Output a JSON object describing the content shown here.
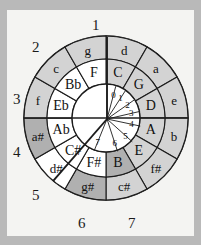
{
  "diagram": {
    "center": {
      "x": 106,
      "y": 118
    },
    "radii": {
      "outer": 82,
      "ring_mid": 59,
      "ring_inner": 34,
      "core": 22
    },
    "colors": {
      "page_background": "#b9b9b9",
      "paper": "#f4f4f2",
      "shaded_sector": "#b0b0b0",
      "light_sector": "#d3d3d3",
      "white_sector": "#ffffff",
      "stroke": "#1c1c1c",
      "text": "#111111"
    },
    "outer_ring": {
      "name": "minor-keys-ring",
      "segments": [
        {
          "label": "d",
          "angle": -75,
          "fill": "light"
        },
        {
          "label": "a",
          "angle": -45,
          "fill": "light"
        },
        {
          "label": "e",
          "angle": -15,
          "fill": "light"
        },
        {
          "label": "b",
          "angle": 15,
          "fill": "light"
        },
        {
          "label": "f#",
          "angle": 45,
          "fill": "light"
        },
        {
          "label": "c#",
          "angle": 75,
          "fill": "light"
        },
        {
          "label": "g#",
          "angle": 105,
          "fill": "shaded"
        },
        {
          "label": "d#",
          "angle": 135,
          "fill": "white"
        },
        {
          "label": "a#",
          "angle": 165,
          "fill": "shaded"
        },
        {
          "label": "f",
          "angle": -165,
          "fill": "light"
        },
        {
          "label": "c",
          "angle": -135,
          "fill": "light"
        },
        {
          "label": "g",
          "angle": -105,
          "fill": "light"
        }
      ]
    },
    "middle_ring": {
      "name": "major-keys-ring",
      "segments": [
        {
          "label": "C",
          "angle": -75,
          "fill": "light"
        },
        {
          "label": "G",
          "angle": -45,
          "fill": "light"
        },
        {
          "label": "D",
          "angle": -15,
          "fill": "light"
        },
        {
          "label": "A",
          "angle": 15,
          "fill": "light"
        },
        {
          "label": "E",
          "angle": 45,
          "fill": "light"
        },
        {
          "label": "B",
          "angle": 75,
          "fill": "shaded"
        },
        {
          "label": "F#",
          "angle": 105,
          "fill": "white"
        },
        {
          "label": "C#",
          "angle": 135,
          "fill": "white"
        },
        {
          "label": "Ab",
          "angle": 165,
          "fill": "white"
        },
        {
          "label": "Eb",
          "angle": -165,
          "fill": "white"
        },
        {
          "label": "Bb",
          "angle": -135,
          "fill": "white"
        },
        {
          "label": "F",
          "angle": -105,
          "fill": "white"
        }
      ]
    },
    "inner_fan": {
      "name": "accidental-count-fan",
      "segments": [
        {
          "label": "0",
          "angle": -75
        },
        {
          "label": "1",
          "angle": -57
        },
        {
          "label": "2",
          "angle": -35
        },
        {
          "label": "3",
          "angle": -13
        },
        {
          "label": "4",
          "angle": 12
        },
        {
          "label": "5",
          "angle": 42
        },
        {
          "label": "6",
          "angle": 72
        },
        {
          "label": "7",
          "angle": 112
        }
      ]
    },
    "external_labels": [
      {
        "label": "1",
        "x": 92,
        "y": 18
      },
      {
        "label": "2",
        "x": 32,
        "y": 40
      },
      {
        "label": "3",
        "x": 13,
        "y": 92
      },
      {
        "label": "4",
        "x": 13,
        "y": 145
      },
      {
        "label": "5",
        "x": 32,
        "y": 188
      },
      {
        "label": "6",
        "x": 78,
        "y": 216
      },
      {
        "label": "7",
        "x": 128,
        "y": 216
      }
    ]
  }
}
